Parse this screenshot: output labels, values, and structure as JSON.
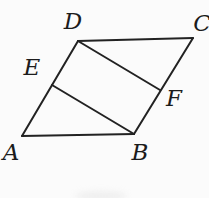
{
  "figure": {
    "background_color": "#fbfbfb",
    "stroke_color": "#222222",
    "stroke_width": 2,
    "label_color": "#1c1c1c",
    "points": {
      "A": {
        "x": 22,
        "y": 136
      },
      "B": {
        "x": 134,
        "y": 134
      },
      "C": {
        "x": 193,
        "y": 38
      },
      "D": {
        "x": 78,
        "y": 41
      },
      "E": {
        "x": 52,
        "y": 85
      },
      "F": {
        "x": 160,
        "y": 90
      }
    },
    "segments": [
      {
        "from": "A",
        "to": "B"
      },
      {
        "from": "B",
        "to": "C"
      },
      {
        "from": "C",
        "to": "D"
      },
      {
        "from": "D",
        "to": "A"
      },
      {
        "from": "D",
        "to": "F"
      },
      {
        "from": "E",
        "to": "B"
      }
    ],
    "labels": [
      {
        "text": "A",
        "x": 11,
        "y": 152
      },
      {
        "text": "B",
        "x": 140,
        "y": 152
      },
      {
        "text": "C",
        "x": 202,
        "y": 23
      },
      {
        "text": "D",
        "x": 73,
        "y": 21
      },
      {
        "text": "E",
        "x": 32,
        "y": 67
      },
      {
        "text": "F",
        "x": 174,
        "y": 98
      }
    ],
    "artifact": {
      "color": "#e3e3e3",
      "x": 75,
      "y": 191,
      "width": 52,
      "height": 10
    }
  }
}
